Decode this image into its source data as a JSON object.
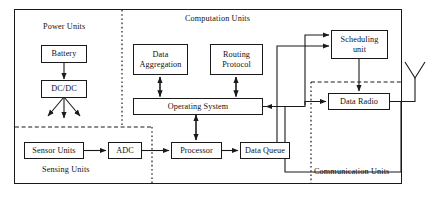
{
  "diagram": {
    "regions": [
      {
        "name": "power-units",
        "label": "Power Units"
      },
      {
        "name": "computation-units",
        "label": "Computation Units"
      },
      {
        "name": "sensing-units",
        "label": "Sensing Units"
      },
      {
        "name": "communication-units",
        "label": "Communication Units"
      }
    ],
    "nodes": [
      {
        "name": "battery",
        "label": "Battery"
      },
      {
        "name": "dc-dc",
        "label": "DC/DC"
      },
      {
        "name": "data-aggregation",
        "label": "Data\nAggregation"
      },
      {
        "name": "data-aggregation-line1",
        "label": "Data"
      },
      {
        "name": "data-aggregation-line2",
        "label": "Aggregation"
      },
      {
        "name": "routing-protocol-line1",
        "label": "Routing"
      },
      {
        "name": "routing-protocol-line2",
        "label": "Protocol"
      },
      {
        "name": "operating-system",
        "label": "Operating System"
      },
      {
        "name": "sensor-units",
        "label": "Sensor Units"
      },
      {
        "name": "adc",
        "label": "ADC"
      },
      {
        "name": "processor",
        "label": "Processor"
      },
      {
        "name": "data-queue",
        "label": "Data Queue"
      },
      {
        "name": "scheduling-unit-line1",
        "label": "Scheduling"
      },
      {
        "name": "scheduling-unit-line2",
        "label": "unit"
      },
      {
        "name": "data-radio",
        "label": "Data Radio"
      }
    ],
    "icons": [
      {
        "name": "antenna-icon",
        "label": "antenna"
      }
    ],
    "colors": {
      "stroke": "#1a1a1a",
      "background": "#ffffff",
      "text": "#111111"
    }
  }
}
